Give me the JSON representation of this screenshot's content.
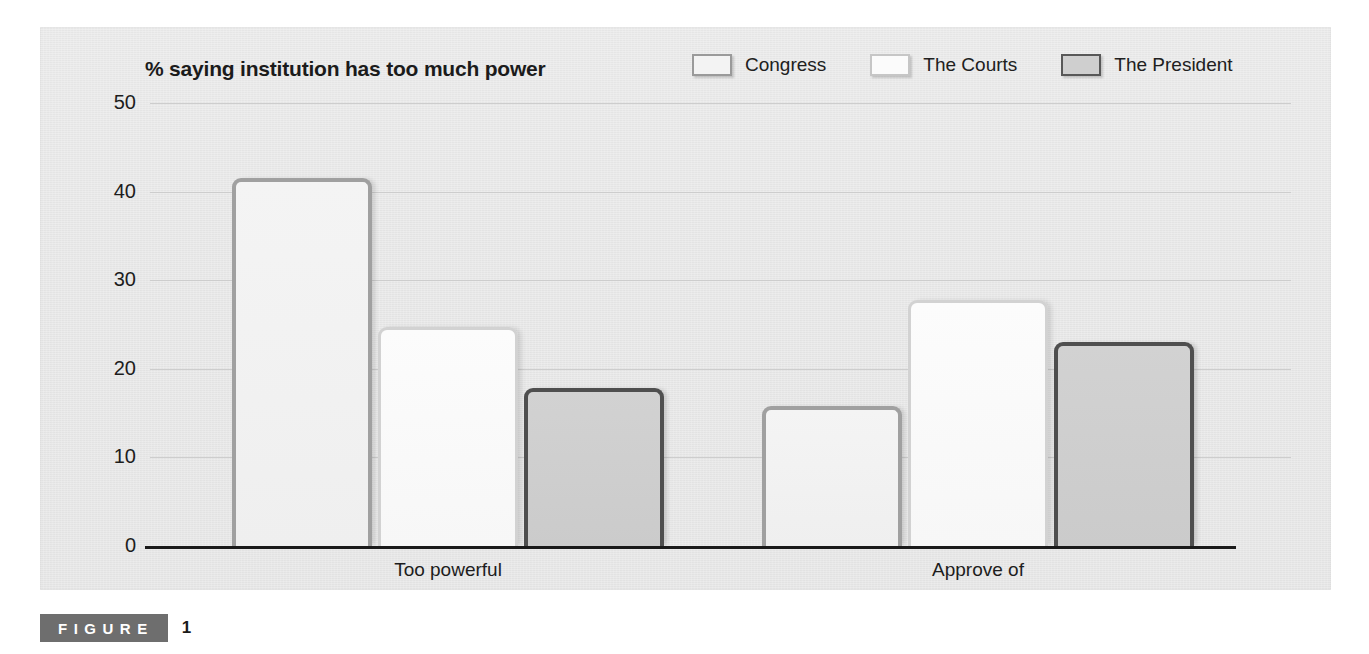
{
  "figure": {
    "word_label": "FIGURE",
    "number_label": "1"
  },
  "chart_data": {
    "type": "bar",
    "title": "% saying institution has too much power",
    "xlabel": "",
    "ylabel": "",
    "ylim": [
      0,
      50
    ],
    "yticks": [
      50,
      40,
      30,
      20,
      10,
      0
    ],
    "grid": true,
    "legend_position": "top-right",
    "categories": [
      "Too powerful",
      "Approve of"
    ],
    "series": [
      {
        "name": "Congress",
        "values": [
          41.5,
          15.8
        ],
        "fill": "#f2f2f2",
        "border": "#a0a0a0"
      },
      {
        "name": "The Courts",
        "values": [
          24.7,
          27.8
        ],
        "fill": "#fbfbfb",
        "border": "#d2d2d2"
      },
      {
        "name": "The President",
        "values": [
          17.8,
          23.0
        ],
        "fill": "#cfcfcf",
        "border": "#4f4f4f"
      }
    ]
  }
}
